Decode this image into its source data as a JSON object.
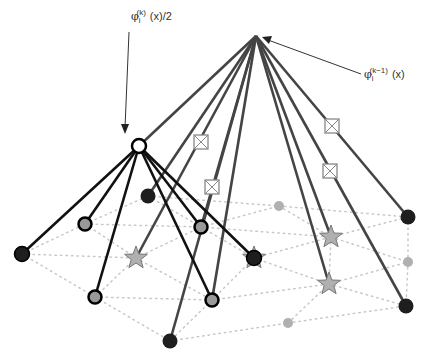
{
  "labels": {
    "half_phi": {
      "symbol": "φ",
      "sub": "i",
      "sup": "(k)",
      "arg": "(x)/2"
    },
    "prev_phi": {
      "symbol": "φ",
      "sub": "i",
      "sup": "(k−1)",
      "arg": "(x)"
    }
  },
  "colors": {
    "dark_edge": "#111111",
    "gray_edge": "#444444",
    "mesh": "#c8c8c8",
    "dark_node": "#1e1e1e",
    "gray_node": "#999999",
    "light_node": "#b0b0b0"
  },
  "apex": {
    "x": 256,
    "y": 36
  },
  "child": {
    "x": 139,
    "y": 146
  },
  "apex_targets": [
    {
      "x": 148,
      "y": 196
    },
    {
      "x": 136,
      "y": 258
    },
    {
      "x": 201,
      "y": 227
    },
    {
      "x": 212,
      "y": 300
    },
    {
      "x": 170,
      "y": 341
    },
    {
      "x": 331,
      "y": 237
    },
    {
      "x": 329,
      "y": 284
    },
    {
      "x": 408,
      "y": 217
    },
    {
      "x": 406,
      "y": 306
    }
  ],
  "child_targets": [
    {
      "x": 22,
      "y": 254,
      "type": "dark"
    },
    {
      "x": 85,
      "y": 224,
      "type": "ring"
    },
    {
      "x": 95,
      "y": 297,
      "type": "ring"
    },
    {
      "x": 201,
      "y": 227,
      "type": "ring"
    },
    {
      "x": 212,
      "y": 300,
      "type": "ring"
    },
    {
      "x": 254,
      "y": 258,
      "type": "dark"
    }
  ],
  "boxes": [
    {
      "x": 201,
      "y": 142
    },
    {
      "x": 212,
      "y": 187
    },
    {
      "x": 332,
      "y": 126
    },
    {
      "x": 330,
      "y": 171
    }
  ],
  "stars": [
    {
      "x": 136,
      "y": 258
    },
    {
      "x": 254,
      "y": 258
    },
    {
      "x": 331,
      "y": 237
    },
    {
      "x": 329,
      "y": 284
    }
  ],
  "small_dots": [
    {
      "x": 279,
      "y": 206
    },
    {
      "x": 408,
      "y": 262
    },
    {
      "x": 288,
      "y": 323
    }
  ],
  "mesh_edges": [
    [
      22,
      254,
      85,
      224
    ],
    [
      22,
      254,
      95,
      297
    ],
    [
      22,
      254,
      136,
      258
    ],
    [
      85,
      224,
      148,
      196
    ],
    [
      85,
      224,
      136,
      258
    ],
    [
      85,
      224,
      201,
      227
    ],
    [
      95,
      297,
      136,
      258
    ],
    [
      95,
      297,
      212,
      300
    ],
    [
      95,
      297,
      170,
      341
    ],
    [
      148,
      196,
      201,
      227
    ],
    [
      148,
      196,
      279,
      206
    ],
    [
      136,
      258,
      201,
      227
    ],
    [
      136,
      258,
      212,
      300
    ],
    [
      201,
      227,
      254,
      258
    ],
    [
      201,
      227,
      279,
      206
    ],
    [
      201,
      227,
      331,
      237
    ],
    [
      212,
      300,
      254,
      258
    ],
    [
      212,
      300,
      170,
      341
    ],
    [
      212,
      300,
      329,
      284
    ],
    [
      170,
      341,
      288,
      323
    ],
    [
      254,
      258,
      331,
      237
    ],
    [
      254,
      258,
      329,
      284
    ],
    [
      279,
      206,
      331,
      237
    ],
    [
      279,
      206,
      408,
      217
    ],
    [
      331,
      237,
      408,
      217
    ],
    [
      331,
      237,
      408,
      262
    ],
    [
      331,
      237,
      329,
      284
    ],
    [
      329,
      284,
      408,
      262
    ],
    [
      329,
      284,
      406,
      306
    ],
    [
      329,
      284,
      288,
      323
    ],
    [
      288,
      323,
      406,
      306
    ],
    [
      408,
      217,
      408,
      262
    ],
    [
      408,
      262,
      406,
      306
    ]
  ]
}
